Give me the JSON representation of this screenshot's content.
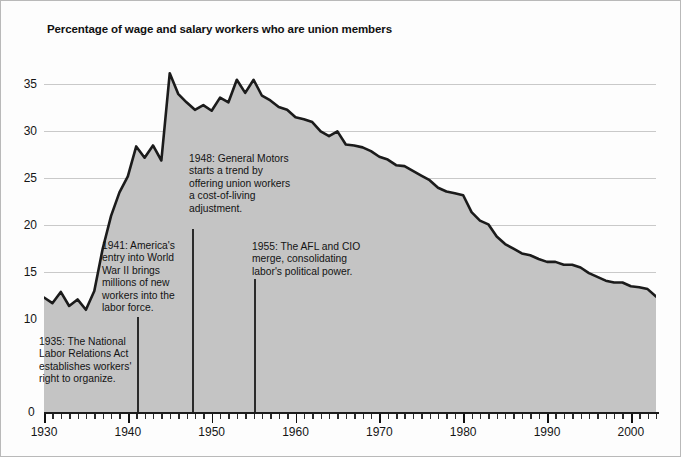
{
  "chart_data": {
    "type": "area",
    "title": "Percentage of wage and salary workers who are union members",
    "xlabel": "",
    "ylabel": "",
    "xlim": [
      1930,
      2003
    ],
    "ylim": [
      0,
      37.5
    ],
    "grid": true,
    "legend": "none",
    "series_color": "#1b1b1b",
    "fill_color": "#c4c4c4",
    "y_ticks": [
      0,
      10,
      15,
      20,
      25,
      30,
      35
    ],
    "y_tick_labels": [
      "0",
      "10",
      "15",
      "20",
      "25",
      "30",
      "35"
    ],
    "x_ticks": [
      1930,
      1940,
      1950,
      1960,
      1970,
      1980,
      1990,
      2000
    ],
    "x_tick_labels": [
      "1930",
      "1940",
      "1950",
      "1960",
      "1970",
      "1980",
      "1990",
      "2000"
    ],
    "x_minor_tick_interval": 1,
    "x": [
      1930,
      1931,
      1932,
      1933,
      1934,
      1935,
      1936,
      1937,
      1938,
      1939,
      1940,
      1941,
      1942,
      1943,
      1944,
      1945,
      1946,
      1947,
      1948,
      1949,
      1950,
      1951,
      1952,
      1953,
      1954,
      1955,
      1956,
      1957,
      1958,
      1959,
      1960,
      1961,
      1962,
      1963,
      1964,
      1965,
      1966,
      1967,
      1968,
      1969,
      1970,
      1971,
      1972,
      1973,
      1974,
      1975,
      1976,
      1977,
      1978,
      1979,
      1980,
      1981,
      1982,
      1983,
      1984,
      1985,
      1986,
      1987,
      1988,
      1989,
      1990,
      1991,
      1992,
      1993,
      1994,
      1995,
      1996,
      1997,
      1998,
      1999,
      2000,
      2001,
      2002,
      2003
    ],
    "y": [
      12.3,
      11.7,
      12.9,
      11.4,
      12.1,
      11.0,
      13.0,
      17.5,
      21.0,
      23.5,
      25.2,
      28.4,
      27.2,
      28.5,
      26.9,
      36.2,
      34.0,
      33.1,
      32.3,
      32.8,
      32.2,
      33.6,
      33.1,
      35.5,
      34.1,
      35.5,
      33.8,
      33.3,
      32.6,
      32.3,
      31.5,
      31.3,
      31.0,
      30.0,
      29.5,
      30.0,
      28.6,
      28.5,
      28.3,
      27.9,
      27.3,
      27.0,
      26.4,
      26.3,
      25.8,
      25.3,
      24.8,
      24.0,
      23.6,
      23.4,
      23.2,
      21.4,
      20.5,
      20.1,
      18.8,
      18.0,
      17.5,
      17.0,
      16.8,
      16.4,
      16.1,
      16.1,
      15.8,
      15.8,
      15.5,
      14.9,
      14.5,
      14.1,
      13.9,
      13.9,
      13.5,
      13.4,
      13.2,
      12.4
    ],
    "annotations": [
      {
        "id": "nlra-1935",
        "year": 1935,
        "text": "1935: The National\nLabor Relations Act\nestablishes workers'\nright to organize.",
        "x_px": 38,
        "y_px": 335,
        "marker": false
      },
      {
        "id": "wwii-1941",
        "year": 1941,
        "text": "1941: America's\nentry into World\nWar II brings\nmillions of new\nworkers into the\nlabor force.",
        "x_px": 101,
        "y_px": 239,
        "marker": true,
        "marker_x_px": 136,
        "marker_top_px": 316,
        "marker_height_px": 95
      },
      {
        "id": "gm-cola-1948",
        "year": 1948,
        "text": "1948: General Motors\nstarts a trend by\noffering union workers\na cost-of-living\nadjustment.",
        "x_px": 188,
        "y_px": 152,
        "marker": true,
        "marker_x_px": 191,
        "marker_top_px": 228,
        "marker_height_px": 183
      },
      {
        "id": "afl-cio-1955",
        "year": 1955,
        "text": "1955: The AFL and CIO\nmerge, consolidating\nlabor's political power.",
        "x_px": 251,
        "y_px": 240,
        "marker": true,
        "marker_x_px": 253,
        "marker_top_px": 278,
        "marker_height_px": 133
      }
    ]
  }
}
